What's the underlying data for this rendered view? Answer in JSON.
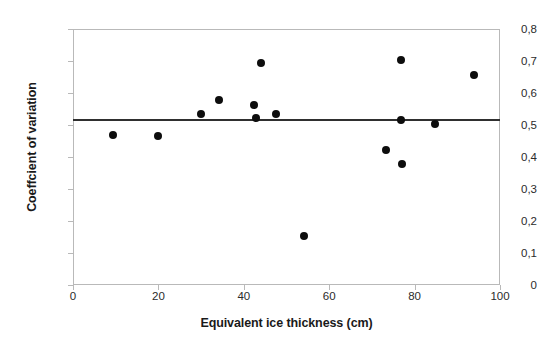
{
  "chart_data": {
    "type": "scatter",
    "title": "",
    "xlabel": "Equivalent ice thickness (cm)",
    "ylabel": "Coeffcient of variation",
    "xlim": [
      0,
      100
    ],
    "ylim": [
      0,
      0.8
    ],
    "grid": false,
    "legend": null,
    "decimal_separator": ",",
    "xticks": [
      0,
      20,
      40,
      60,
      80,
      100
    ],
    "xtick_labels": [
      "0",
      "20",
      "40",
      "60",
      "80",
      "100"
    ],
    "yticks": [
      0,
      0.1,
      0.2,
      0.3,
      0.4,
      0.5,
      0.6,
      0.7,
      0.8
    ],
    "ytick_labels": [
      "0",
      "0,1",
      "0,2",
      "0,3",
      "0,4",
      "0,5",
      "0,6",
      "0,7",
      "0,8"
    ],
    "points": [
      {
        "x": 9.4,
        "y": 0.468
      },
      {
        "x": 19.9,
        "y": 0.465
      },
      {
        "x": 30.0,
        "y": 0.535
      },
      {
        "x": 34.2,
        "y": 0.577
      },
      {
        "x": 42.4,
        "y": 0.563
      },
      {
        "x": 42.8,
        "y": 0.522
      },
      {
        "x": 44.1,
        "y": 0.693
      },
      {
        "x": 47.5,
        "y": 0.535
      },
      {
        "x": 54.0,
        "y": 0.152
      },
      {
        "x": 73.2,
        "y": 0.423
      },
      {
        "x": 76.8,
        "y": 0.703
      },
      {
        "x": 76.9,
        "y": 0.517
      },
      {
        "x": 77.1,
        "y": 0.378
      },
      {
        "x": 84.8,
        "y": 0.502
      },
      {
        "x": 93.9,
        "y": 0.655
      }
    ],
    "reference_line": {
      "orientation": "horizontal",
      "value": 0.515,
      "color": "#2f2f2f"
    },
    "marker_color": "#0d0d0d",
    "frame_color": "#b9b9b9"
  }
}
